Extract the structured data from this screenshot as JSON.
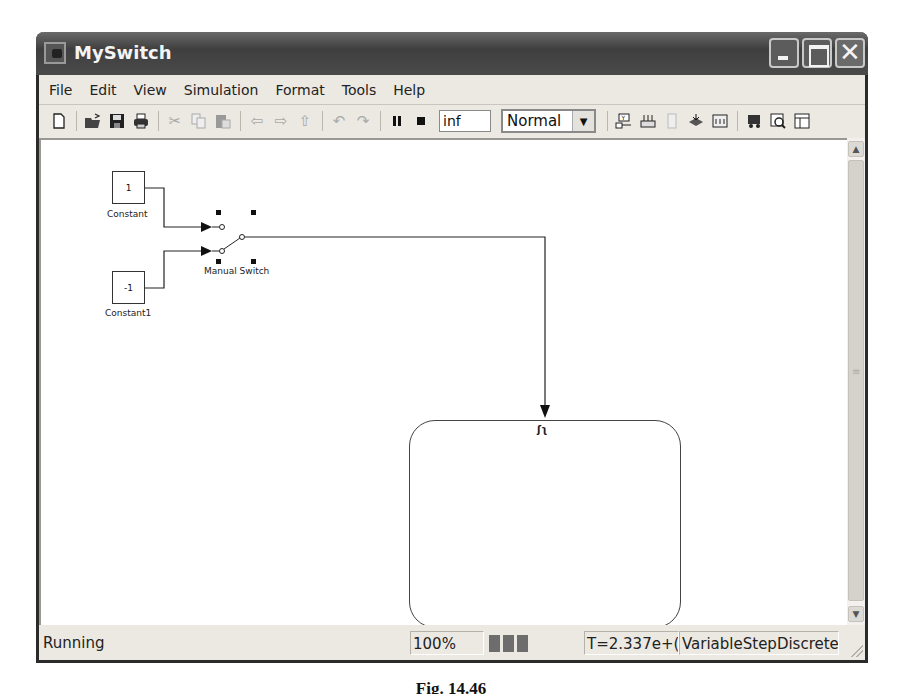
{
  "window": {
    "title": "MySwitch",
    "controls": {
      "minimize": "_",
      "maximize": "□",
      "close": "✕"
    }
  },
  "menu": {
    "items": [
      {
        "label": "File",
        "mnemonic": "F"
      },
      {
        "label": "Edit",
        "mnemonic": "E"
      },
      {
        "label": "View",
        "mnemonic": "V"
      },
      {
        "label": "Simulation",
        "mnemonic": "S"
      },
      {
        "label": "Format",
        "mnemonic": "o"
      },
      {
        "label": "Tools",
        "mnemonic": "T"
      },
      {
        "label": "Help",
        "mnemonic": "H"
      }
    ]
  },
  "toolbar": {
    "icons": [
      "new-file-icon",
      "open-folder-icon",
      "save-icon",
      "print-icon",
      "cut-icon",
      "copy-icon",
      "paste-icon",
      "back-arrow-icon",
      "forward-arrow-icon",
      "up-arrow-icon",
      "undo-icon",
      "redo-icon",
      "pause-icon",
      "stop-icon",
      "build-icon",
      "update-diagram-icon",
      "debug-icon",
      "library-browser-icon",
      "model-explorer-icon",
      "target-icon",
      "zoom-view-icon",
      "properties-icon"
    ],
    "stop_time": "inf",
    "sim_mode": "Normal"
  },
  "diagram": {
    "blocks": [
      {
        "name": "Constant",
        "value": "1"
      },
      {
        "name": "Constant1",
        "value": "-1"
      },
      {
        "name": "Manual Switch"
      },
      {
        "name": "Controller",
        "trigger_symbol": "ʃʅ"
      }
    ]
  },
  "statusbar": {
    "status": "Running",
    "zoom": "100%",
    "progress_blocks": 3,
    "time": "T=2.337e+(",
    "solver": "VariableStepDiscrete"
  },
  "caption": "Fig. 14.46"
}
